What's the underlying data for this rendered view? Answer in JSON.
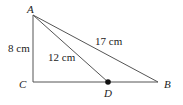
{
  "diagram": {
    "type": "geometry-triangle",
    "points": {
      "A": {
        "label": "A",
        "x": 33,
        "y": 15
      },
      "B": {
        "label": "B",
        "x": 158,
        "y": 82
      },
      "C": {
        "label": "C",
        "x": 33,
        "y": 82
      },
      "D": {
        "label": "D",
        "x": 108,
        "y": 82
      }
    },
    "segments": [
      {
        "from": "A",
        "to": "C",
        "label": "8 cm"
      },
      {
        "from": "A",
        "to": "B",
        "label": "17 cm"
      },
      {
        "from": "A",
        "to": "D",
        "label": "12 cm"
      },
      {
        "from": "C",
        "to": "B",
        "label": ""
      }
    ],
    "labels": {
      "ac": "8 cm",
      "ab": "17 cm",
      "ad": "12 cm"
    },
    "line_color": "#555555",
    "point_color": "#111111"
  }
}
